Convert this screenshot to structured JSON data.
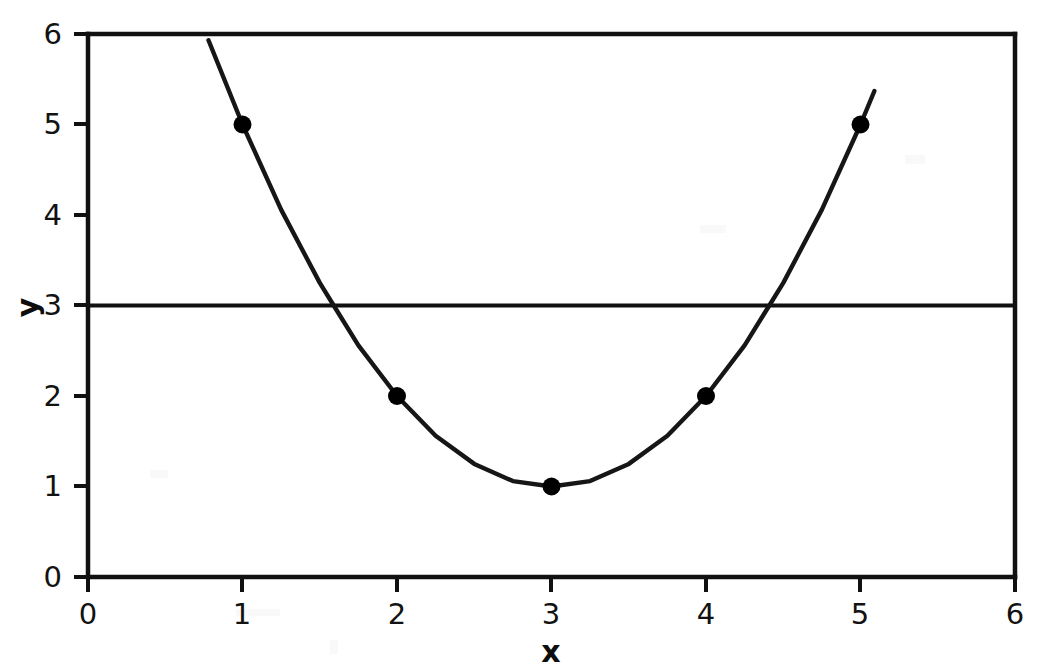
{
  "chart_data": {
    "type": "line",
    "title": "",
    "subtitle": "",
    "xlabel": "x",
    "ylabel": "y",
    "xlim": [
      0,
      6
    ],
    "ylim": [
      0,
      6
    ],
    "xticks": [
      0,
      1,
      2,
      3,
      4,
      5,
      6
    ],
    "yticks": [
      0,
      1,
      2,
      3,
      4,
      5,
      6
    ],
    "xtick_labels": [
      "0",
      "1",
      "2",
      "3",
      "4",
      "5",
      "6"
    ],
    "ytick_labels": [
      "0",
      "1",
      "2",
      "3",
      "4",
      "5",
      "6"
    ],
    "grid": false,
    "legend": null,
    "legend_position": "none",
    "background_color": "#ffffff",
    "line_color": "#111111",
    "marker_color": "#000000",
    "axis_color": "#111111",
    "series": [
      {
        "name": "parabola",
        "type": "line",
        "equation": "y = (x - 3)^2 + 1",
        "x_start": 0.78,
        "x_end": 5.09,
        "curve_points": [
          {
            "x": 0.78,
            "y": 5.93
          },
          {
            "x": 1.0,
            "y": 5.0
          },
          {
            "x": 1.25,
            "y": 4.06
          },
          {
            "x": 1.5,
            "y": 3.25
          },
          {
            "x": 1.59,
            "y": 3.0
          },
          {
            "x": 1.75,
            "y": 2.56
          },
          {
            "x": 2.0,
            "y": 2.0
          },
          {
            "x": 2.25,
            "y": 1.56
          },
          {
            "x": 2.5,
            "y": 1.25
          },
          {
            "x": 2.75,
            "y": 1.06
          },
          {
            "x": 3.0,
            "y": 1.0
          },
          {
            "x": 3.25,
            "y": 1.06
          },
          {
            "x": 3.5,
            "y": 1.25
          },
          {
            "x": 3.75,
            "y": 1.56
          },
          {
            "x": 4.0,
            "y": 2.0
          },
          {
            "x": 4.25,
            "y": 2.56
          },
          {
            "x": 4.41,
            "y": 3.0
          },
          {
            "x": 4.5,
            "y": 3.25
          },
          {
            "x": 4.75,
            "y": 4.06
          },
          {
            "x": 5.0,
            "y": 5.0
          },
          {
            "x": 5.09,
            "y": 5.37
          }
        ]
      },
      {
        "name": "data-points",
        "type": "scatter",
        "marker": "filled-circle",
        "marker_size": 18,
        "points": [
          {
            "x": 1,
            "y": 5
          },
          {
            "x": 2,
            "y": 2
          },
          {
            "x": 3,
            "y": 1
          },
          {
            "x": 4,
            "y": 2
          },
          {
            "x": 5,
            "y": 5
          }
        ]
      },
      {
        "name": "horizontal-reference-line",
        "type": "line",
        "value": 3,
        "orientation": "horizontal",
        "x_from": 0,
        "x_to": 6
      }
    ],
    "annotations": [
      {
        "text": "y = 3 reference line spanning full plot width",
        "type": "hline",
        "y": 3
      },
      {
        "text": "vertex of parabola",
        "x": 3,
        "y": 1
      }
    ]
  },
  "axes": {
    "x_axis_name": "x-axis",
    "y_axis_name": "y-axis",
    "top_border": true,
    "right_border": true,
    "bottom_border": true,
    "left_border": true
  }
}
